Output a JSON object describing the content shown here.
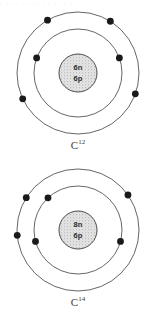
{
  "page": {
    "background_color": "#ffffff",
    "width": 156,
    "height": 325,
    "cropped_top_text": "· ·· ·  ··· ·· ·   · · ·· ·"
  },
  "style": {
    "shell_stroke_color": "#555555",
    "electron_color": "#1a1a1a",
    "nucleus_fill_color": "#e2e2e2",
    "nucleus_stroke_color": "#4a4a4a",
    "label_color": "#3a3a3a"
  },
  "diagrams": [
    {
      "id": "carbon-12",
      "label_element": "C",
      "label_mass_number": "12",
      "nucleus": {
        "neutrons_text": "6n",
        "protons_text": "6p",
        "neutrons": 6,
        "protons": 6
      },
      "shells": [
        {
          "name": "inner-shell",
          "radius": 44,
          "electron_count": 2,
          "electron_angles": [
            160,
            20
          ]
        },
        {
          "name": "outer-shell",
          "radius": 61,
          "electron_count": 4,
          "electron_angles": [
            120,
            58,
            205,
            340
          ]
        }
      ]
    },
    {
      "id": "carbon-14",
      "label_element": "C",
      "label_mass_number": "14",
      "nucleus": {
        "neutrons_text": "8n",
        "protons_text": "6p",
        "neutrons": 8,
        "protons": 6
      },
      "shells": [
        {
          "name": "inner-shell",
          "radius": 44,
          "electron_count": 3,
          "electron_angles": [
            133,
            195,
            345
          ]
        },
        {
          "name": "outer-shell",
          "radius": 61,
          "electron_count": 3,
          "electron_angles": [
            148,
            35,
            185
          ]
        }
      ]
    }
  ]
}
